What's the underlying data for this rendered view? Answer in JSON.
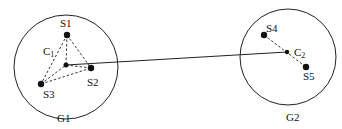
{
  "groups": [
    {
      "label": "G1",
      "centroid": "C1",
      "nodes": [
        "S1",
        "S2",
        "S3"
      ]
    },
    {
      "label": "G2",
      "centroid": "C2",
      "nodes": [
        "S4",
        "S5"
      ]
    }
  ],
  "labels": {
    "s1": "S1",
    "s2": "S2",
    "s3": "S3",
    "s4": "S4",
    "s5": "S5",
    "c1": "C",
    "c1_sub": "1",
    "c2": "C",
    "c2_sub": "2",
    "g1": "G1",
    "g2": "G2"
  },
  "colors": {
    "stroke": "#111111",
    "background": "#ffffff"
  }
}
